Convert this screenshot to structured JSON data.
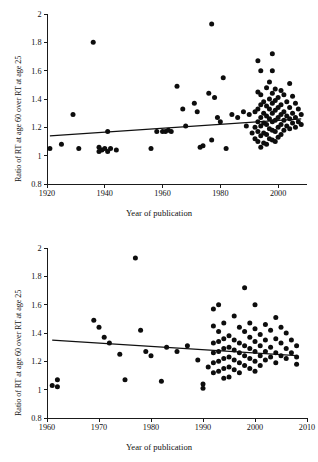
{
  "figure": {
    "background": "#ffffff",
    "point_color": "#0d0d0d",
    "line_color": "#111111"
  },
  "chart_data": [
    {
      "type": "scatter",
      "panel": "top",
      "title": "",
      "xlabel": "Year of publication",
      "ylabel": "Ratio of RT at age 60 over RT at age 25",
      "xlim": [
        1920,
        2010
      ],
      "ylim": [
        0.8,
        2.0
      ],
      "xticks": [
        1920,
        1940,
        1960,
        1980,
        2000
      ],
      "yticks": [
        0.8,
        1,
        1.2,
        1.4,
        1.6,
        1.8,
        2
      ],
      "ytick_labels": [
        "0.8",
        "1",
        "1.2",
        "1.4",
        "1.6",
        "1.8",
        "2"
      ],
      "xtick_labels": [
        "1920",
        "1940",
        "1960",
        "1980",
        "2000"
      ],
      "grid": false,
      "legend": null,
      "trendline": {
        "x": [
          1921,
          2008
        ],
        "y": [
          1.14,
          1.26
        ]
      },
      "points": [
        [
          1921,
          1.05
        ],
        [
          1925,
          1.08
        ],
        [
          1929,
          1.29
        ],
        [
          1931,
          1.05
        ],
        [
          1936,
          1.8
        ],
        [
          1938,
          1.03
        ],
        [
          1938,
          1.06
        ],
        [
          1939,
          1.04
        ],
        [
          1940,
          1.05
        ],
        [
          1941,
          1.03
        ],
        [
          1941,
          1.17
        ],
        [
          1942,
          1.05
        ],
        [
          1944,
          1.04
        ],
        [
          1956,
          1.05
        ],
        [
          1958,
          1.17
        ],
        [
          1960,
          1.17
        ],
        [
          1961,
          1.17
        ],
        [
          1962,
          1.18
        ],
        [
          1963,
          1.17
        ],
        [
          1965,
          1.49
        ],
        [
          1967,
          1.33
        ],
        [
          1968,
          1.21
        ],
        [
          1971,
          1.37
        ],
        [
          1972,
          1.31
        ],
        [
          1973,
          1.06
        ],
        [
          1974,
          1.07
        ],
        [
          1976,
          1.44
        ],
        [
          1977,
          1.93
        ],
        [
          1977,
          1.11
        ],
        [
          1978,
          1.41
        ],
        [
          1979,
          1.27
        ],
        [
          1980,
          1.24
        ],
        [
          1981,
          1.55
        ],
        [
          1982,
          1.05
        ],
        [
          1984,
          1.29
        ],
        [
          1986,
          1.27
        ],
        [
          1988,
          1.31
        ],
        [
          1989,
          1.21
        ],
        [
          1990,
          1.29
        ],
        [
          1991,
          1.16
        ],
        [
          1992,
          1.31
        ],
        [
          1992,
          1.2
        ],
        [
          1992,
          1.12
        ],
        [
          1993,
          1.67
        ],
        [
          1993,
          1.45
        ],
        [
          1993,
          1.33
        ],
        [
          1993,
          1.24
        ],
        [
          1993,
          1.17
        ],
        [
          1993,
          1.1
        ],
        [
          1994,
          1.6
        ],
        [
          1994,
          1.43
        ],
        [
          1994,
          1.36
        ],
        [
          1994,
          1.27
        ],
        [
          1994,
          1.21
        ],
        [
          1994,
          1.14
        ],
        [
          1994,
          1.06
        ],
        [
          1995,
          1.38
        ],
        [
          1995,
          1.3
        ],
        [
          1995,
          1.23
        ],
        [
          1995,
          1.16
        ],
        [
          1995,
          1.09
        ],
        [
          1996,
          1.48
        ],
        [
          1996,
          1.35
        ],
        [
          1996,
          1.28
        ],
        [
          1996,
          1.22
        ],
        [
          1996,
          1.15
        ],
        [
          1996,
          1.08
        ],
        [
          1997,
          1.52
        ],
        [
          1997,
          1.4
        ],
        [
          1997,
          1.33
        ],
        [
          1997,
          1.26
        ],
        [
          1997,
          1.19
        ],
        [
          1997,
          1.12
        ],
        [
          1998,
          1.72
        ],
        [
          1998,
          1.6
        ],
        [
          1998,
          1.44
        ],
        [
          1998,
          1.37
        ],
        [
          1998,
          1.3
        ],
        [
          1998,
          1.24
        ],
        [
          1998,
          1.18
        ],
        [
          1998,
          1.11
        ],
        [
          1999,
          1.47
        ],
        [
          1999,
          1.39
        ],
        [
          1999,
          1.32
        ],
        [
          1999,
          1.25
        ],
        [
          1999,
          1.17
        ],
        [
          1999,
          1.1
        ],
        [
          2000,
          1.41
        ],
        [
          2000,
          1.34
        ],
        [
          2000,
          1.27
        ],
        [
          2000,
          1.2
        ],
        [
          2000,
          1.13
        ],
        [
          2001,
          1.46
        ],
        [
          2001,
          1.36
        ],
        [
          2001,
          1.29
        ],
        [
          2001,
          1.22
        ],
        [
          2001,
          1.15
        ],
        [
          2002,
          1.43
        ],
        [
          2002,
          1.31
        ],
        [
          2002,
          1.25
        ],
        [
          2002,
          1.18
        ],
        [
          2003,
          1.38
        ],
        [
          2003,
          1.28
        ],
        [
          2003,
          1.21
        ],
        [
          2004,
          1.51
        ],
        [
          2004,
          1.34
        ],
        [
          2004,
          1.26
        ],
        [
          2004,
          1.19
        ],
        [
          2005,
          1.42
        ],
        [
          2005,
          1.3
        ],
        [
          2005,
          1.23
        ],
        [
          2006,
          1.37
        ],
        [
          2006,
          1.27
        ],
        [
          2006,
          1.2
        ],
        [
          2007,
          1.33
        ],
        [
          2007,
          1.24
        ],
        [
          2008,
          1.29
        ],
        [
          2008,
          1.22
        ]
      ]
    },
    {
      "type": "scatter",
      "panel": "bottom",
      "title": "",
      "xlabel": "Year of publication",
      "ylabel": "Ratio of RT at age 60 over RT at age 25",
      "xlim": [
        1960,
        2010
      ],
      "ylim": [
        0.8,
        2.0
      ],
      "xticks": [
        1960,
        1970,
        1980,
        1990,
        2000,
        2010
      ],
      "yticks": [
        0.8,
        1,
        1.2,
        1.4,
        1.6,
        1.8,
        2
      ],
      "ytick_labels": [
        "0.8",
        "1",
        "1.2",
        "1.4",
        "1.6",
        "1.8",
        "2"
      ],
      "xtick_labels": [
        "1960",
        "1970",
        "1980",
        "1990",
        "2000",
        "2010"
      ],
      "grid": false,
      "legend": null,
      "trendline": {
        "x": [
          1961,
          2008
        ],
        "y": [
          1.35,
          1.24
        ]
      },
      "points": [
        [
          1961,
          1.03
        ],
        [
          1962,
          1.07
        ],
        [
          1962,
          1.02
        ],
        [
          1969,
          1.49
        ],
        [
          1970,
          1.44
        ],
        [
          1971,
          1.37
        ],
        [
          1972,
          1.33
        ],
        [
          1974,
          1.25
        ],
        [
          1975,
          1.07
        ],
        [
          1977,
          1.93
        ],
        [
          1978,
          1.42
        ],
        [
          1979,
          1.27
        ],
        [
          1980,
          1.24
        ],
        [
          1982,
          1.06
        ],
        [
          1983,
          1.3
        ],
        [
          1985,
          1.27
        ],
        [
          1987,
          1.31
        ],
        [
          1989,
          1.21
        ],
        [
          1990,
          1.04
        ],
        [
          1990,
          1.01
        ],
        [
          1991,
          1.16
        ],
        [
          1992,
          1.57
        ],
        [
          1992,
          1.45
        ],
        [
          1992,
          1.33
        ],
        [
          1992,
          1.26
        ],
        [
          1992,
          1.19
        ],
        [
          1992,
          1.12
        ],
        [
          1993,
          1.6
        ],
        [
          1993,
          1.41
        ],
        [
          1993,
          1.34
        ],
        [
          1993,
          1.27
        ],
        [
          1993,
          1.2
        ],
        [
          1993,
          1.13
        ],
        [
          1994,
          1.47
        ],
        [
          1994,
          1.36
        ],
        [
          1994,
          1.29
        ],
        [
          1994,
          1.22
        ],
        [
          1994,
          1.15
        ],
        [
          1994,
          1.08
        ],
        [
          1995,
          1.38
        ],
        [
          1995,
          1.3
        ],
        [
          1995,
          1.23
        ],
        [
          1995,
          1.16
        ],
        [
          1995,
          1.09
        ],
        [
          1996,
          1.52
        ],
        [
          1996,
          1.35
        ],
        [
          1996,
          1.28
        ],
        [
          1996,
          1.21
        ],
        [
          1996,
          1.14
        ],
        [
          1997,
          1.44
        ],
        [
          1997,
          1.33
        ],
        [
          1997,
          1.26
        ],
        [
          1997,
          1.19
        ],
        [
          1997,
          1.12
        ],
        [
          1998,
          1.72
        ],
        [
          1998,
          1.41
        ],
        [
          1998,
          1.31
        ],
        [
          1998,
          1.24
        ],
        [
          1998,
          1.17
        ],
        [
          1999,
          1.47
        ],
        [
          1999,
          1.37
        ],
        [
          1999,
          1.29
        ],
        [
          1999,
          1.22
        ],
        [
          1999,
          1.15
        ],
        [
          2000,
          1.6
        ],
        [
          2000,
          1.43
        ],
        [
          2000,
          1.34
        ],
        [
          2000,
          1.27
        ],
        [
          2000,
          1.2
        ],
        [
          2000,
          1.13
        ],
        [
          2001,
          1.39
        ],
        [
          2001,
          1.31
        ],
        [
          2001,
          1.24
        ],
        [
          2001,
          1.17
        ],
        [
          2002,
          1.46
        ],
        [
          2002,
          1.35
        ],
        [
          2002,
          1.27
        ],
        [
          2002,
          1.21
        ],
        [
          2003,
          1.42
        ],
        [
          2003,
          1.3
        ],
        [
          2003,
          1.23
        ],
        [
          2004,
          1.51
        ],
        [
          2004,
          1.36
        ],
        [
          2004,
          1.26
        ],
        [
          2004,
          1.19
        ],
        [
          2005,
          1.44
        ],
        [
          2005,
          1.33
        ],
        [
          2005,
          1.24
        ],
        [
          2006,
          1.4
        ],
        [
          2006,
          1.29
        ],
        [
          2006,
          1.22
        ],
        [
          2007,
          1.35
        ],
        [
          2007,
          1.26
        ],
        [
          2008,
          1.31
        ],
        [
          2008,
          1.23
        ],
        [
          2008,
          1.18
        ]
      ]
    }
  ]
}
